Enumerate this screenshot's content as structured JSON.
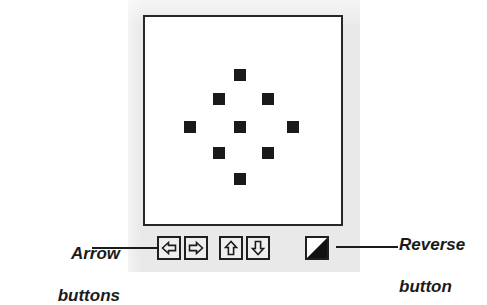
{
  "panel": {
    "background_color": "#e9e9e9",
    "canvas": {
      "background_color": "#ffffff",
      "border_color": "#272727",
      "cell_color": "#1a1a1a",
      "pattern_name": "diamond",
      "cell_size": 12,
      "cells": [
        {
          "name": "cell-top",
          "x": 89,
          "y": 52
        },
        {
          "name": "cell-upper-left",
          "x": 68,
          "y": 76
        },
        {
          "name": "cell-upper-right",
          "x": 117,
          "y": 76
        },
        {
          "name": "cell-left",
          "x": 39,
          "y": 104
        },
        {
          "name": "cell-center",
          "x": 89,
          "y": 104
        },
        {
          "name": "cell-right",
          "x": 142,
          "y": 104
        },
        {
          "name": "cell-lower-left",
          "x": 68,
          "y": 130
        },
        {
          "name": "cell-lower-right",
          "x": 117,
          "y": 130
        },
        {
          "name": "cell-bottom",
          "x": 89,
          "y": 156
        }
      ]
    }
  },
  "toolbar": {
    "buttons": [
      {
        "name": "arrow-left-button",
        "icon": "arrow-left-icon",
        "title": "Scroll left"
      },
      {
        "name": "arrow-right-button",
        "icon": "arrow-right-icon",
        "title": "Scroll right"
      },
      {
        "name": "arrow-up-button",
        "icon": "arrow-up-icon",
        "title": "Scroll up"
      },
      {
        "name": "arrow-down-button",
        "icon": "arrow-down-icon",
        "title": "Scroll down"
      },
      {
        "name": "reverse-button",
        "icon": "reverse-icon",
        "title": "Reverse"
      }
    ]
  },
  "callouts": {
    "arrow": {
      "text": "Arrow\nbuttons",
      "line1": "Arrow",
      "line2": "buttons"
    },
    "reverse": {
      "text": "Reverse\nbutton",
      "line1": "Reverse",
      "line2": "button"
    }
  }
}
